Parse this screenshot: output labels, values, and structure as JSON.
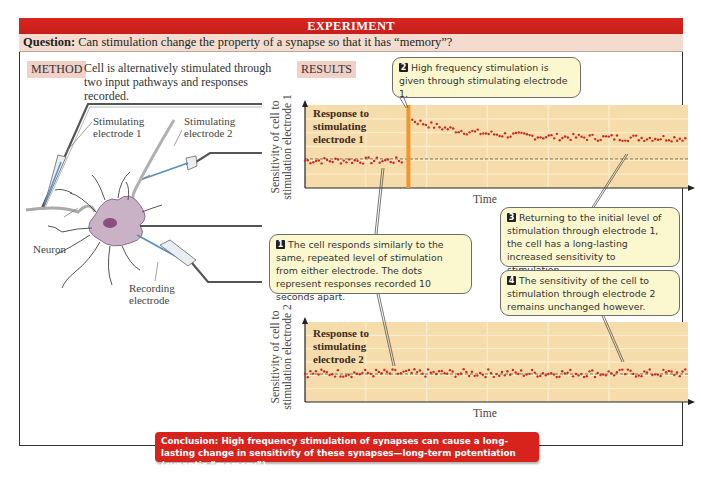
{
  "header": {
    "title": "EXPERIMENT",
    "question_label": "Question:",
    "question_text": " Can stimulation change the property of a synapse so that it has “memory”?"
  },
  "method": {
    "tag": "METHOD",
    "text": "Cell is alternatively stimulated through two input pathways and responses recorded."
  },
  "results": {
    "tag": "RESULTS"
  },
  "diagram": {
    "labels": {
      "electrode1": [
        "Stimulating",
        "electrode 1"
      ],
      "electrode2": [
        "Stimulating",
        "electrode 2"
      ],
      "neuron": "Neuron",
      "recording": [
        "Recording",
        "electrode"
      ]
    },
    "icons": [
      "stimulating-electrode-1",
      "stimulating-electrode-2",
      "neuron-cell",
      "recording-electrode"
    ]
  },
  "callouts": [
    {
      "num": "1",
      "text": "The cell responds similarly to the same, repeated level of stimulation from either electrode. The dots represent responses recorded 10 seconds apart."
    },
    {
      "num": "2",
      "text": "High frequency stimulation is given through stimulating electrode 1."
    },
    {
      "num": "3",
      "text": "Returning to the initial level of stimulation through electrode 1, the cell has a long-lasting increased sensitivity to stimulation."
    },
    {
      "num": "4",
      "text": "The sensitivity of the cell to stimulation through electrode 2 remains unchanged however."
    }
  ],
  "conclusion": {
    "text": "Conclusion: High frequency stimulation of synapses can cause a long-lasting change in sensitivity of these synapses—long-term potentiation (synaptic “memory”)."
  },
  "colors": {
    "header_red": "#d9241f",
    "question_bg": "#f3dccf",
    "plot_bg": "#f6dcaa",
    "dot_red": "#d0281f",
    "stim_bar": "#f0962c",
    "callout_bg": "#fbf7cf",
    "conclusion_red": "#d8221c"
  },
  "chart_data": [
    {
      "type": "scatter",
      "title": "Response to stimulating electrode 1",
      "panel_label": [
        "Response to",
        "stimulating",
        "electrode 1"
      ],
      "xlabel": "Time",
      "ylabel": [
        "Sensitivity of cell to",
        "stimulation electrode 1"
      ],
      "baseline": 0.35,
      "ylim": [
        0,
        1
      ],
      "grid": true,
      "annotation": "High frequency stimulation at t≈0.27 (orange bar)",
      "stim_time": 0.27,
      "series": [
        {
          "name": "before stimulation",
          "x_range": [
            0,
            0.26
          ],
          "mean": 0.33,
          "noise": 0.04
        },
        {
          "name": "after stimulation",
          "x_range": [
            0.28,
            1.0
          ],
          "start": 0.82,
          "plateau": 0.6,
          "noise": 0.04
        }
      ]
    },
    {
      "type": "scatter",
      "title": "Response to stimulating electrode 2",
      "panel_label": [
        "Response to",
        "stimulating",
        "electrode 2"
      ],
      "xlabel": "Time",
      "ylabel": [
        "Sensitivity of cell to",
        "stimulation electrode 2"
      ],
      "baseline": 0.35,
      "ylim": [
        0,
        1
      ],
      "grid": true,
      "series": [
        {
          "name": "electrode 2 responses",
          "x_range": [
            0,
            1.0
          ],
          "mean": 0.36,
          "noise": 0.05
        }
      ]
    }
  ]
}
